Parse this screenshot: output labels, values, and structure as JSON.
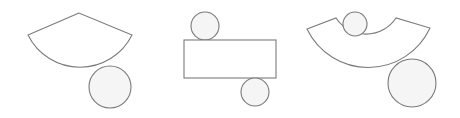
{
  "figures": [
    {
      "name": "cone-net",
      "description": "Circular sector (cone lateral surface) with a circular base tangent below",
      "sector": {
        "apex": [
          79,
          13
        ],
        "left": [
          28,
          35
        ],
        "right": [
          132,
          35
        ],
        "arc_bottom": [
          79,
          70
        ]
      },
      "base_circle": {
        "cx": 110,
        "cy": 87,
        "r": 21
      }
    },
    {
      "name": "cylinder-net",
      "description": "Rectangle with two circles, one tangent on top and one tangent below",
      "rect": {
        "x": 184,
        "y": 40,
        "width": 92,
        "height": 38
      },
      "top_circle": {
        "cx": 205,
        "cy": 27,
        "r": 14
      },
      "bottom_circle": {
        "cx": 255,
        "cy": 92,
        "r": 14
      }
    },
    {
      "name": "frustum-net",
      "description": "Annular sector with small circle inside top and large circle tangent below",
      "annular_sector": {
        "outer_left": [
          308,
          29
        ],
        "outer_right": [
          430,
          29
        ],
        "inner_left": [
          336,
          19
        ],
        "inner_right": [
          396,
          19
        ]
      },
      "small_circle": {
        "cx": 354,
        "cy": 27,
        "r": 12
      },
      "large_circle": {
        "cx": 412,
        "cy": 83,
        "r": 24
      }
    }
  ],
  "colors": {
    "stroke": "#7a7a7a",
    "circle_fill": "#f5f5f5",
    "background": "#ffffff"
  }
}
